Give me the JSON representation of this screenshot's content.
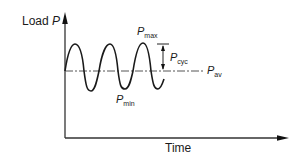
{
  "diagram": {
    "y_axis_label": {
      "text": "Load",
      "symbol": "P"
    },
    "x_axis_label": "Time",
    "annotations": {
      "p_max": {
        "symbol": "P",
        "subscript": "max"
      },
      "p_min": {
        "symbol": "P",
        "subscript": "min"
      },
      "p_cyc": {
        "symbol": "P",
        "subscript": "cyc"
      },
      "p_av": {
        "symbol": "P",
        "subscript": "av"
      }
    },
    "colors": {
      "curve": "#1a1a1a",
      "axis": "#333333",
      "average_line": "#555555",
      "background": "#ffffff"
    }
  }
}
